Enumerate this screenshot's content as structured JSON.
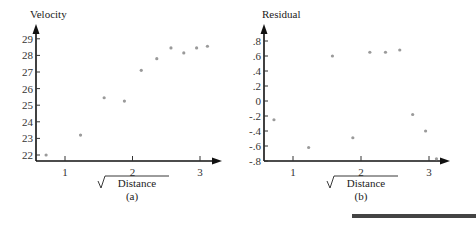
{
  "chart_data": [
    {
      "type": "scatter",
      "panel_label": "(a)",
      "title": "",
      "xlabel": "√Distance",
      "ylabel": "Velocity",
      "xlim": [
        0.55,
        3.35
      ],
      "ylim": [
        21.65,
        29.8
      ],
      "x_ticks": [
        1,
        2,
        3
      ],
      "y_ticks": [
        22,
        23,
        24,
        25,
        26,
        27,
        28,
        29
      ],
      "grid": false,
      "x": [
        0.72,
        1.23,
        1.58,
        1.88,
        2.13,
        2.36,
        2.57,
        2.76,
        2.95,
        3.11
      ],
      "y": [
        22.0,
        23.2,
        25.45,
        25.25,
        27.1,
        27.8,
        28.45,
        28.15,
        28.45,
        28.55
      ]
    },
    {
      "type": "scatter",
      "panel_label": "(b)",
      "title": "",
      "xlabel": "√Distance",
      "ylabel": "Residual",
      "xlim": [
        0.58,
        3.3
      ],
      "ylim": [
        -0.8,
        1.0
      ],
      "x_ticks": [
        1,
        2,
        3
      ],
      "y_ticks": [
        ".8",
        ".6",
        ".4",
        ".2",
        "0",
        "-.2",
        "-.4",
        "-.6",
        "-.8"
      ],
      "y_tick_values": [
        0.8,
        0.6,
        0.4,
        0.2,
        0,
        -0.2,
        -0.4,
        -0.6,
        -0.8
      ],
      "grid": false,
      "x": [
        0.72,
        1.23,
        1.58,
        1.88,
        2.13,
        2.36,
        2.57,
        2.76,
        2.95,
        3.11
      ],
      "y": [
        -0.25,
        -0.62,
        0.6,
        -0.49,
        0.65,
        0.65,
        0.68,
        -0.18,
        -0.4,
        -0.77
      ]
    }
  ],
  "labels": {
    "a_ylabel": "Velocity",
    "a_xlabel": "Distance",
    "a_panel": "(a)",
    "b_ylabel": "Residual",
    "b_xlabel": "Distance",
    "b_panel": "(b)"
  }
}
